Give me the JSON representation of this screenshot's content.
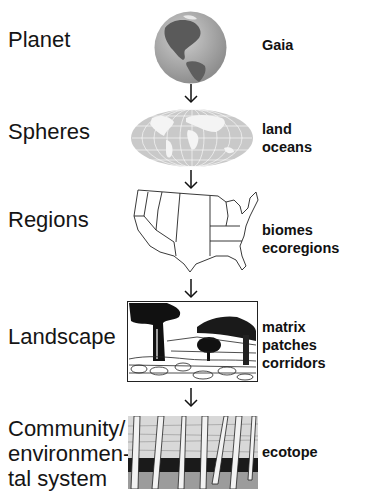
{
  "diagram": {
    "type": "hierarchy",
    "direction": "top-to-bottom",
    "levels": [
      {
        "label": "Planet",
        "image": "globe-icon",
        "descriptors": [
          "Gaia"
        ]
      },
      {
        "label": "Spheres",
        "image": "world-map-icon",
        "descriptors": [
          "land",
          "oceans"
        ]
      },
      {
        "label": "Regions",
        "image": "us-map-icon",
        "descriptors": [
          "biomes",
          "ecoregions"
        ]
      },
      {
        "label": "Landscape",
        "image": "landscape-illustration",
        "descriptors": [
          "matrix",
          "patches",
          "corridors"
        ]
      },
      {
        "label_lines": [
          "Community/",
          "environmen-",
          "tal system"
        ],
        "image": "birch-forest-illustration",
        "descriptors": [
          "ecotope"
        ]
      }
    ],
    "connector": "down-arrow"
  },
  "colors": {
    "text": "#111111",
    "globe_ocean": "#a8a8a8",
    "globe_land": "#555555",
    "map_fill": "#c9c9c9"
  }
}
